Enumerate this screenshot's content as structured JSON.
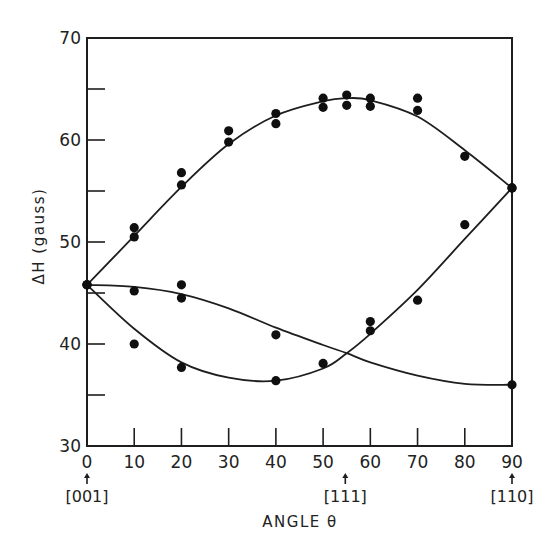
{
  "chart_data": {
    "type": "scatter",
    "title": "",
    "xlabel": "ANGLE θ",
    "ylabel": "ΔH (gauss)",
    "xlim": [
      0,
      90
    ],
    "ylim": [
      30,
      70
    ],
    "grid": false,
    "legend": null,
    "x_ticks": [
      0,
      10,
      20,
      30,
      40,
      50,
      60,
      70,
      80,
      90
    ],
    "y_ticks_labeled": [
      30,
      40,
      50,
      60,
      70
    ],
    "y_ticks_minor": [
      35,
      45,
      55,
      65
    ],
    "direction_annotations": [
      {
        "x": 0,
        "label": "[001]",
        "overbar": ""
      },
      {
        "x": 54.7,
        "label": "[111]",
        "overbar": ""
      },
      {
        "x": 90,
        "label": "[110]",
        "overbar": "0"
      }
    ],
    "series": [
      {
        "name": "upper curve",
        "points": [
          [
            0,
            45.8
          ],
          [
            10,
            51.4
          ],
          [
            10,
            50.5
          ],
          [
            20,
            56.8
          ],
          [
            20,
            55.6
          ],
          [
            30,
            60.9
          ],
          [
            30,
            59.8
          ],
          [
            40,
            62.6
          ],
          [
            40,
            61.6
          ],
          [
            50,
            64.1
          ],
          [
            50,
            63.2
          ],
          [
            55,
            64.4
          ],
          [
            55,
            63.4
          ],
          [
            60,
            64.1
          ],
          [
            60,
            63.3
          ],
          [
            70,
            64.1
          ],
          [
            70,
            62.9
          ],
          [
            80,
            58.4
          ],
          [
            90,
            55.3
          ]
        ],
        "fit": [
          [
            0,
            45.8
          ],
          [
            10,
            50.6
          ],
          [
            20,
            55.4
          ],
          [
            30,
            59.6
          ],
          [
            40,
            62.4
          ],
          [
            50,
            63.8
          ],
          [
            55,
            64.1
          ],
          [
            60,
            63.9
          ],
          [
            70,
            62.3
          ],
          [
            80,
            59.0
          ],
          [
            90,
            55.3
          ]
        ]
      },
      {
        "name": "middle curve",
        "points": [
          [
            0,
            45.8
          ],
          [
            10,
            45.2
          ],
          [
            20,
            45.8
          ],
          [
            20,
            44.5
          ],
          [
            40,
            40.9
          ],
          [
            90,
            36.0
          ]
        ],
        "fit": [
          [
            0,
            45.8
          ],
          [
            10,
            45.6
          ],
          [
            20,
            44.9
          ],
          [
            30,
            43.5
          ],
          [
            40,
            41.6
          ],
          [
            50,
            39.9
          ],
          [
            55,
            39.1
          ],
          [
            60,
            38.2
          ],
          [
            70,
            36.9
          ],
          [
            80,
            36.1
          ],
          [
            90,
            36.0
          ]
        ]
      },
      {
        "name": "lower curve",
        "points": [
          [
            0,
            45.8
          ],
          [
            10,
            40.0
          ],
          [
            20,
            37.7
          ],
          [
            40,
            36.4
          ],
          [
            50,
            38.1
          ],
          [
            60,
            42.2
          ],
          [
            60,
            41.3
          ],
          [
            70,
            44.3
          ],
          [
            80,
            51.7
          ],
          [
            90,
            55.3
          ]
        ],
        "fit": [
          [
            0,
            45.8
          ],
          [
            10,
            41.5
          ],
          [
            20,
            38.2
          ],
          [
            30,
            36.7
          ],
          [
            40,
            36.4
          ],
          [
            50,
            37.6
          ],
          [
            55,
            39.1
          ],
          [
            60,
            41.0
          ],
          [
            70,
            45.3
          ],
          [
            80,
            50.3
          ],
          [
            90,
            55.3
          ]
        ]
      }
    ]
  }
}
